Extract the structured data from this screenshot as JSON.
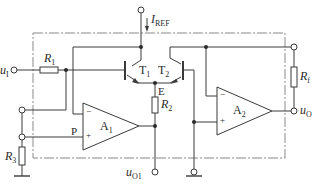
{
  "diagram": {
    "type": "circuit-schematic",
    "colors": {
      "wire": "#3a3a3a",
      "dashed_box": "#8a8a8a",
      "background": "#ffffff"
    },
    "labels": {
      "iref": {
        "main": "I",
        "sub": "REF"
      },
      "ui": {
        "main": "u",
        "sub": "I"
      },
      "r1": {
        "main": "R",
        "sub": "1"
      },
      "t1": {
        "main": "T",
        "sub": "1"
      },
      "t2": {
        "main": "T",
        "sub": "2"
      },
      "e": "E",
      "r2": {
        "main": "R",
        "sub": "2"
      },
      "rf": {
        "main": "R",
        "sub": "f"
      },
      "a1": {
        "main": "A",
        "sub": "1"
      },
      "a2": {
        "main": "A",
        "sub": "2"
      },
      "p": "P",
      "r3": {
        "main": "R",
        "sub": "3"
      },
      "uo1": {
        "main": "u",
        "sub": "O1"
      },
      "uo": {
        "main": "u",
        "sub": "O"
      },
      "minus": "−",
      "plus": "+"
    }
  }
}
